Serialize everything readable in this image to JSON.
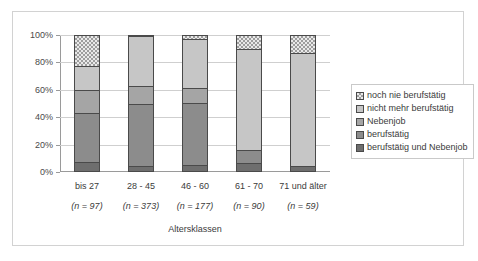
{
  "chart_data": {
    "type": "bar",
    "stacked": true,
    "normalized": "100%",
    "title": "",
    "xlabel": "Altersklassen",
    "ylabel": "",
    "ylim": [
      0,
      100
    ],
    "ytick_labels": [
      "0%",
      "20%",
      "40%",
      "60%",
      "80%",
      "100%"
    ],
    "ytick_values": [
      0,
      20,
      40,
      60,
      80,
      100
    ],
    "grid": true,
    "legend_position": "right",
    "categories": [
      "bis 27",
      "28 - 45",
      "46 - 60",
      "61 - 70",
      "71 und älter"
    ],
    "category_sublabels": [
      "(n = 97)",
      "(n = 373)",
      "(n = 177)",
      "(n = 90)",
      "(n = 59)"
    ],
    "series": [
      {
        "name": "berufstätig und Nebenjob",
        "color": "#6e6e6e",
        "pattern": "solid",
        "values": [
          6,
          3,
          4,
          5.5,
          3
        ]
      },
      {
        "name": "berufstätig",
        "color": "#8c8c8c",
        "pattern": "solid",
        "values": [
          36,
          46,
          46,
          9,
          0
        ]
      },
      {
        "name": "Nebenjob",
        "color": "#a5a5a5",
        "pattern": "solid",
        "values": [
          17,
          13,
          11,
          0,
          0
        ]
      },
      {
        "name": "nicht mehr berufstätig",
        "color": "#c6c6c6",
        "pattern": "solid",
        "values": [
          18,
          37,
          36,
          75,
          84
        ]
      },
      {
        "name": "noch nie berufstätig",
        "color": "#e9e9e9",
        "pattern": "checkerboard",
        "values": [
          23,
          1,
          3,
          10.5,
          13
        ]
      }
    ]
  },
  "legend": {
    "items": [
      "noch nie berufstätig",
      "nicht mehr berufstätig",
      "Nebenjob",
      "berufstätig",
      "berufstätig und Nebenjob"
    ]
  }
}
